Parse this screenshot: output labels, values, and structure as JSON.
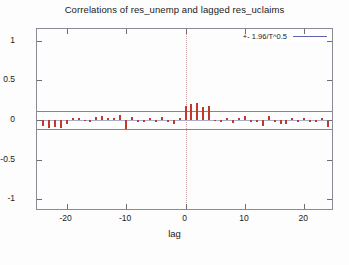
{
  "chart_data": {
    "type": "bar",
    "title": "Correlations of res_unemp and lagged res_uclaims",
    "xlabel": "lag",
    "ylabel": "",
    "grid": false,
    "legend_position": "top-right",
    "legend": [
      {
        "name": "+- 1.96/T^0.5",
        "color": "#5b64ac",
        "style": "line"
      }
    ],
    "xlim": [
      -25,
      25
    ],
    "ylim": [
      -1.15,
      1.15
    ],
    "xticks": [
      -20,
      -10,
      0,
      10,
      20
    ],
    "xtick_labels": [
      "-20",
      "-10",
      "0",
      "10",
      "20"
    ],
    "yticks": [
      -1,
      -0.5,
      0,
      0.5,
      1
    ],
    "ytick_labels": [
      "-1",
      "-0.5",
      "0",
      "0.5",
      "1"
    ],
    "bar_color": "#c0392b",
    "confidence_band": 0.12,
    "confidence_band_color": "#7b82b4",
    "zero_reference_line": 0,
    "lag0_marker_line": 0,
    "x": [
      -24,
      -23,
      -22,
      -21,
      -20,
      -19,
      -18,
      -17,
      -16,
      -15,
      -14,
      -13,
      -12,
      -11,
      -10,
      -9,
      -8,
      -7,
      -6,
      -5,
      -4,
      -3,
      -2,
      -1,
      0,
      1,
      2,
      3,
      4,
      5,
      6,
      7,
      8,
      9,
      10,
      11,
      12,
      13,
      14,
      15,
      16,
      17,
      18,
      19,
      20,
      21,
      22,
      23,
      24
    ],
    "values": [
      -0.07,
      -0.1,
      -0.09,
      -0.1,
      -0.05,
      0.03,
      0.03,
      -0.01,
      -0.02,
      0.04,
      0.05,
      0.03,
      0.02,
      0.06,
      -0.12,
      0.04,
      -0.02,
      -0.02,
      0.02,
      -0.02,
      0.04,
      -0.03,
      -0.05,
      0.03,
      0.18,
      0.2,
      0.22,
      0.17,
      0.18,
      -0.01,
      -0.02,
      0.02,
      -0.04,
      0.03,
      0.05,
      -0.02,
      -0.03,
      -0.07,
      0.05,
      -0.02,
      -0.05,
      -0.05,
      0.02,
      -0.02,
      0.02,
      -0.02,
      -0.03,
      0.03,
      -0.09
    ]
  }
}
